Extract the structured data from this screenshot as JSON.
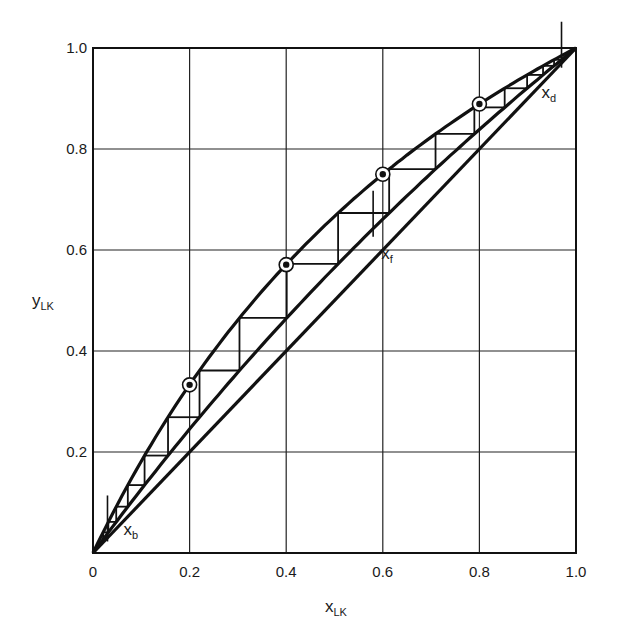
{
  "chart_data": {
    "type": "line",
    "title": "",
    "xlabel": "x",
    "xlabel_sub": "LK",
    "ylabel": "y",
    "ylabel_sub": "LK",
    "xlim": [
      0,
      1.0
    ],
    "ylim": [
      0,
      1.0
    ],
    "grid": true,
    "x_ticks": [
      "0",
      "0.2",
      "0.4",
      "0.6",
      "0.8",
      "1.0"
    ],
    "y_ticks": [
      "0.2",
      "0.4",
      "0.6",
      "0.8",
      "1.0"
    ],
    "series": [
      {
        "name": "equilibrium curve",
        "x": [
          0,
          0.05,
          0.1,
          0.15,
          0.2,
          0.3,
          0.4,
          0.5,
          0.6,
          0.7,
          0.8,
          0.9,
          1.0
        ],
        "y": [
          0,
          0.095,
          0.182,
          0.261,
          0.333,
          0.462,
          0.571,
          0.667,
          0.75,
          0.824,
          0.889,
          0.947,
          1.0
        ]
      },
      {
        "name": "operating line",
        "x": [
          0,
          0.1,
          0.2,
          0.3,
          0.4,
          0.5,
          0.6,
          0.7,
          0.8,
          0.9,
          1.0
        ],
        "y": [
          0,
          0.126,
          0.245,
          0.358,
          0.464,
          0.565,
          0.661,
          0.752,
          0.839,
          0.921,
          1.0
        ]
      },
      {
        "name": "diagonal y=x",
        "x": [
          0,
          1.0
        ],
        "y": [
          0,
          1.0
        ]
      }
    ],
    "marked_points": [
      {
        "x": 0.2,
        "y": 0.333
      },
      {
        "x": 0.4,
        "y": 0.571
      },
      {
        "x": 0.6,
        "y": 0.75
      },
      {
        "x": 0.8,
        "y": 0.889
      }
    ],
    "annotations": [
      {
        "text": "x",
        "sub": "b",
        "x": 0.03
      },
      {
        "text": "x",
        "sub": "f",
        "x": 0.58
      },
      {
        "text": "x",
        "sub": "d",
        "x": 0.97
      }
    ],
    "stages": {
      "start_x": 0.97,
      "end_x": 0.03,
      "alpha_equilibrium": 2.0,
      "alpha_operating": 1.3
    }
  }
}
